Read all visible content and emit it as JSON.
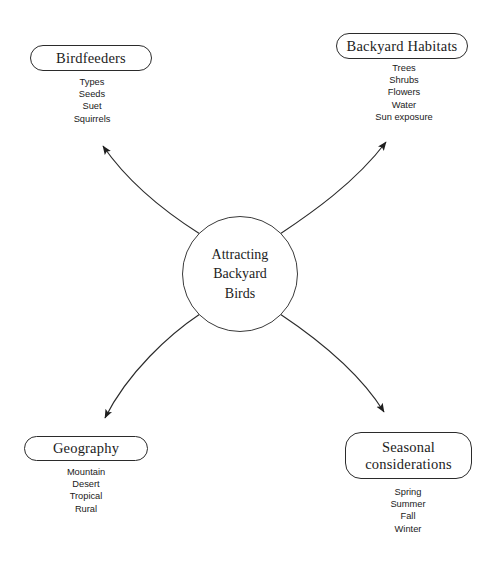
{
  "diagram": {
    "title": "Attracting Backyard Birds",
    "type": "concept-map",
    "center": {
      "label": "Attracting\nBackyard\nBirds",
      "shape": "circle"
    },
    "colors": {
      "stroke": "#2b2b2b",
      "text": "#1c1c1c",
      "background": "#ffffff"
    },
    "branches": [
      {
        "id": "birdfeeders",
        "label": "Birdfeeders",
        "position": "top-left",
        "shape": "pill",
        "items": [
          "Types",
          "Seeds",
          "Suet",
          "Squirrels"
        ]
      },
      {
        "id": "habitats",
        "label": "Backyard Habitats",
        "position": "top-right",
        "shape": "pill",
        "items": [
          "Trees",
          "Shrubs",
          "Flowers",
          "Water",
          "Sun exposure"
        ]
      },
      {
        "id": "geography",
        "label": "Geography",
        "position": "bottom-left",
        "shape": "pill",
        "items": [
          "Mountain",
          "Desert",
          "Tropical",
          "Rural"
        ]
      },
      {
        "id": "seasonal",
        "label": "Seasonal\nconsiderations",
        "position": "bottom-right",
        "shape": "rounded-rect",
        "items": [
          "Spring",
          "Summer",
          "Fall",
          "Winter"
        ]
      }
    ]
  }
}
